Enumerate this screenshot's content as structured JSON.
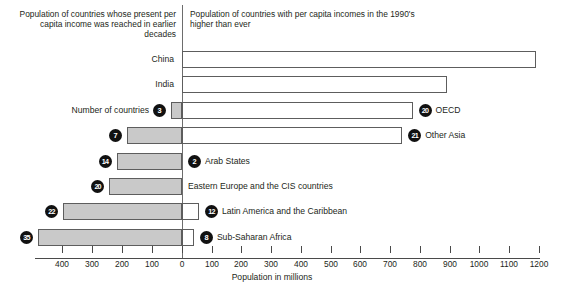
{
  "chart_data": {
    "type": "bar",
    "title": "",
    "orientation": "horizontal-diverging",
    "xlabel": "Population in millions",
    "ylabel": "",
    "grid": false,
    "legend_position": "none",
    "left_caption": "Population of countries whose present per capita income was reached in earlier decades",
    "right_caption": "Population of countries with per capita incomes in the 1990's higher than ever",
    "axis": {
      "ticks": [
        400,
        300,
        200,
        100,
        0,
        100,
        200,
        300,
        400,
        500,
        600,
        700,
        800,
        900,
        1000,
        1100,
        1200
      ],
      "tick_px": [
        62,
        92,
        122,
        152,
        182,
        212,
        241,
        271,
        301,
        331,
        360,
        390,
        420,
        450,
        479,
        509,
        539
      ],
      "left_max": 500,
      "right_max": 1250,
      "zero_px": 182,
      "px_per_million": 0.2975
    },
    "rows": [
      {
        "name": "China",
        "label_side": "left-of-axis",
        "label": "China",
        "left_value": 0,
        "left_countries": null,
        "right_value": 1190,
        "right_countries": null
      },
      {
        "name": "India",
        "label_side": "left-of-axis",
        "label": "India",
        "left_value": 0,
        "left_countries": null,
        "right_value": 890,
        "right_countries": null
      },
      {
        "name": "OECD",
        "label_side": "right",
        "label": "OECD",
        "left_value": 37,
        "left_countries": "3",
        "right_value": 775,
        "right_countries": "20",
        "left_note": "Number of countries"
      },
      {
        "name": "Other Asia",
        "label_side": "right",
        "label": "Other Asia",
        "left_value": 185,
        "left_countries": "7",
        "right_value": 740,
        "right_countries": "21"
      },
      {
        "name": "Arab States",
        "label_side": "right",
        "label": "Arab States",
        "left_value": 220,
        "left_countries": "14",
        "right_value": 0,
        "right_countries": "2"
      },
      {
        "name": "Eastern Europe and the CIS countries",
        "label_side": "right",
        "label": "Eastern Europe and the CIS countries",
        "left_value": 245,
        "left_countries": "20",
        "right_value": 0,
        "right_countries": null
      },
      {
        "name": "Latin America and the Caribbean",
        "label_side": "right",
        "label": "Latin America and the Caribbean",
        "left_value": 400,
        "left_countries": "22",
        "right_value": 57,
        "right_countries": "12"
      },
      {
        "name": "Sub-Saharan Africa",
        "label_side": "right",
        "label": "Sub-Saharan Africa",
        "left_value": 484,
        "left_countries": "35",
        "right_value": 40,
        "right_countries": "8"
      }
    ]
  },
  "annotations": {
    "number_of_countries_note": "Number of countries"
  },
  "colors": {
    "bar_fill_left": "#c9c9c9",
    "bar_fill_right": "#ffffff",
    "bar_stroke": "#5d5d5d",
    "badge_bg": "#111111",
    "badge_text": "#ffffff",
    "text": "#231f20",
    "axis": "#4a4a4a"
  }
}
